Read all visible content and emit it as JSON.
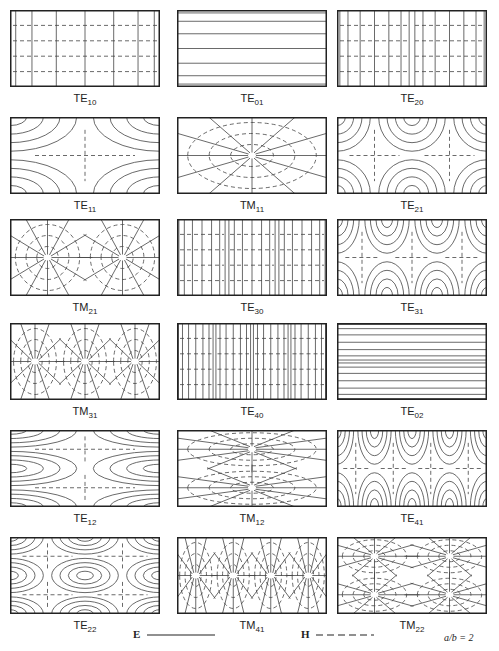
{
  "figure": {
    "aspect_ratio_label": "a/b = 2",
    "legend": [
      {
        "symbol": "E",
        "line": "solid",
        "label": "E"
      },
      {
        "symbol": "H",
        "line": "dashed",
        "label": "H"
      }
    ],
    "panels": [
      {
        "mode": "TE",
        "index": "10",
        "row": 0,
        "col": 0
      },
      {
        "mode": "TE",
        "index": "01",
        "row": 0,
        "col": 1
      },
      {
        "mode": "TE",
        "index": "20",
        "row": 0,
        "col": 2
      },
      {
        "mode": "TE",
        "index": "11",
        "row": 1,
        "col": 0
      },
      {
        "mode": "TM",
        "index": "11",
        "row": 1,
        "col": 1
      },
      {
        "mode": "TE",
        "index": "21",
        "row": 1,
        "col": 2
      },
      {
        "mode": "TM",
        "index": "21",
        "row": 2,
        "col": 0
      },
      {
        "mode": "TE",
        "index": "30",
        "row": 2,
        "col": 1
      },
      {
        "mode": "TE",
        "index": "31",
        "row": 2,
        "col": 2
      },
      {
        "mode": "TM",
        "index": "31",
        "row": 3,
        "col": 0
      },
      {
        "mode": "TE",
        "index": "40",
        "row": 3,
        "col": 1
      },
      {
        "mode": "TE",
        "index": "02",
        "row": 3,
        "col": 2
      },
      {
        "mode": "TE",
        "index": "12",
        "row": 4,
        "col": 0
      },
      {
        "mode": "TM",
        "index": "12",
        "row": 4,
        "col": 1
      },
      {
        "mode": "TE",
        "index": "41",
        "row": 4,
        "col": 2
      },
      {
        "mode": "TE",
        "index": "22",
        "row": 5,
        "col": 0
      },
      {
        "mode": "TM",
        "index": "41",
        "row": 5,
        "col": 1
      },
      {
        "mode": "TM",
        "index": "22",
        "row": 5,
        "col": 2
      }
    ]
  }
}
